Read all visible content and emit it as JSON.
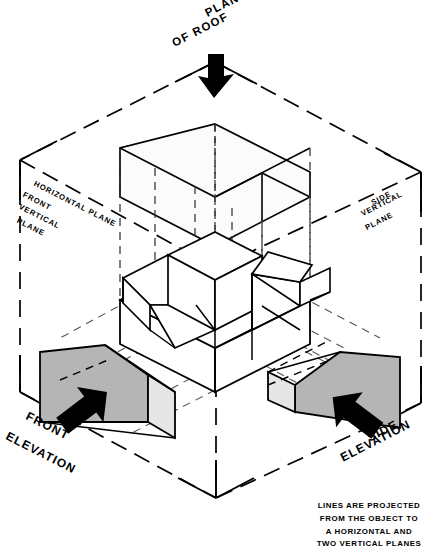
{
  "figure": {
    "title_line1": "PLAN VIEW",
    "title_line2": "OF ROOF",
    "caption": "LINES ARE PROJECTED\nFROM THE OBJECT TO\nA HORIZONTAL AND\nTWO VERTICAL PLANES"
  },
  "plane_labels": {
    "horizontal": "HORIZONTAL PLANE",
    "front_vertical_line1": "FRONT",
    "front_vertical_line2": "VERTICAL",
    "front_vertical_line3": "PLANE",
    "side_vertical_line1": "SIDE",
    "side_vertical_line2": "VERTICAL",
    "side_vertical_line3": "PLANE"
  },
  "view_labels": {
    "front_line1": "FRONT",
    "front_line2": "ELEVATION",
    "side_line1": "SIDE",
    "side_line2": "ELEVATION"
  },
  "icons": {
    "plan_arrow": "arrow-down-icon",
    "front_arrow": "arrow-up-right-icon",
    "side_arrow": "arrow-up-left-icon"
  },
  "colors": {
    "ink": "#000000",
    "paper": "#ffffff",
    "elevation_fill": "#b5b5b5",
    "elevation_light_fill": "#e6e6e6",
    "plan_fill": "#fbfbfb"
  }
}
